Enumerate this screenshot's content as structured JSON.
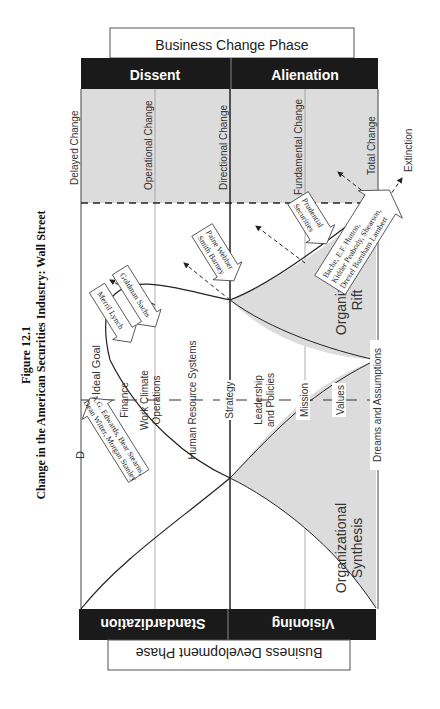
{
  "figure": {
    "number": "Figure 12.1",
    "title": "Change in the American Securities Industry: Wall Street"
  },
  "top_panel": {
    "title": "Business Change Phase",
    "left_header": "Dissent",
    "right_header": "Alienation"
  },
  "bottom_panel": {
    "title": "Business Development Phase",
    "left_header": "Standardization",
    "right_header": "Visioning"
  },
  "change_levels": [
    "Delayed Change",
    "Operational Change",
    "Directional Change",
    "Fundamental Change",
    "Total Change"
  ],
  "axis_levels": [
    "Finance",
    "Work Climate",
    "Operations",
    "Human Resource Systems",
    "Strategy",
    "Leadership",
    "and Policies",
    "Mission",
    "Values",
    "Dreams and Assumptions"
  ],
  "regions": {
    "synthesis_line1": "Organizational",
    "synthesis_line2": "Synthesis",
    "rift_line1": "Organizational",
    "rift_line2": "Rift"
  },
  "ideal_goal": "Ideal Goal",
  "ideal_marker": "D",
  "extinction": "Extinction",
  "callouts": [
    {
      "lines": [
        "A.G. Edwards, Bear Stearns,",
        "Dean Witter, Morgan Stanley"
      ]
    },
    {
      "lines": [
        "Merril Lynch"
      ]
    },
    {
      "lines": [
        "Goldman Sachs"
      ]
    },
    {
      "lines": [
        "Paine Webber",
        "Smith Barney"
      ]
    },
    {
      "lines": [
        "Prudential",
        "Securities"
      ]
    },
    {
      "lines": [
        "Bache, E.F. Hutton,",
        "Kidder Peabody, Shearson,",
        "Drexel Burnham Lambert"
      ]
    }
  ],
  "colors": {
    "band": "#1a1a1a",
    "shade": "#dcdcdc",
    "line": "#222222",
    "grid": "#9a9a9a"
  }
}
